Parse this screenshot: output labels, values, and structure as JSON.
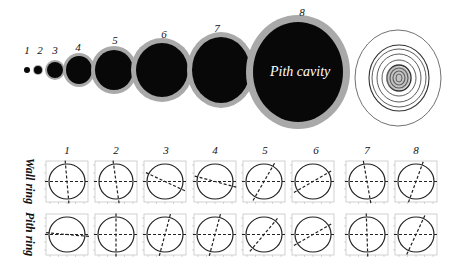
{
  "figure": {
    "top_row": {
      "labels": [
        "1",
        "2",
        "3",
        "4",
        "5",
        "6",
        "7",
        "8"
      ],
      "cross_sections": [
        {
          "id": "1",
          "cx": 27,
          "cy": 70,
          "rx": 3,
          "ry": 3,
          "ring": 0
        },
        {
          "id": "2",
          "cx": 38,
          "cy": 70,
          "rx": 4,
          "ry": 4,
          "ring": 1
        },
        {
          "id": "3",
          "cx": 55,
          "cy": 70,
          "rx": 8,
          "ry": 8,
          "ring": 2
        },
        {
          "id": "4",
          "cx": 79,
          "cy": 70,
          "rx": 13,
          "ry": 14,
          "ring": 3
        },
        {
          "id": "5",
          "cx": 114,
          "cy": 70,
          "rx": 19,
          "ry": 20,
          "ring": 4
        },
        {
          "id": "6",
          "cx": 162,
          "cy": 70,
          "rx": 26,
          "ry": 27,
          "ring": 5
        },
        {
          "id": "7",
          "cx": 221,
          "cy": 70,
          "rx": 29,
          "ry": 33,
          "ring": 5
        },
        {
          "id": "8",
          "cx": 298,
          "cy": 72,
          "rx": 45,
          "ry": 50,
          "ring": 7
        }
      ],
      "cavity_label": "Pith cavity",
      "growth_rings_diagram": "concentric-rings"
    },
    "bottom_rows": {
      "row_labels": [
        "Wall ring",
        "Pith ring"
      ],
      "column_labels": [
        "1",
        "2",
        "3",
        "4",
        "5",
        "6",
        "7",
        "8"
      ],
      "wall_ring_major_axis_angle_deg": [
        95,
        98,
        155,
        165,
        60,
        30,
        100,
        70
      ],
      "pith_ring_major_axis_angle_deg": [
        175,
        90,
        75,
        75,
        50,
        30,
        92,
        65
      ]
    },
    "colors": {
      "cavity": "#080808",
      "wall": "#a9a9a9",
      "line": "#222222",
      "frame": "#bdbdbd"
    }
  }
}
